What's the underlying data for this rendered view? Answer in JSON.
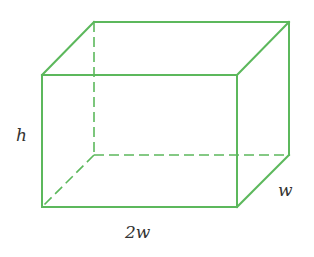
{
  "diagram": {
    "type": "rectangular-prism",
    "stroke_color": "#5cb85c",
    "labels": {
      "height": "h",
      "length": "2w",
      "depth": "w"
    },
    "vertices": {
      "front_top_left": [
        42,
        75
      ],
      "front_top_right": [
        237,
        75
      ],
      "front_bottom_left": [
        42,
        207
      ],
      "front_bottom_right": [
        237,
        207
      ],
      "back_top_left": [
        94,
        22
      ],
      "back_top_right": [
        289,
        22
      ],
      "back_bottom_left": [
        94,
        155
      ],
      "back_bottom_right": [
        289,
        155
      ]
    }
  }
}
